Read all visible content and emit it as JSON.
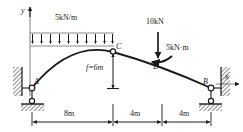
{
  "figure": {
    "type": "three-hinged-arch-free-body-diagram",
    "axes": {
      "y_label": "y",
      "x_label": "x"
    },
    "points": {
      "a": "A",
      "b": "B",
      "c": "C",
      "d": "D"
    },
    "loads": {
      "distributed": "5kN/m",
      "point_force": "10kN",
      "moment": "5kN·m"
    },
    "dimensions": {
      "rise": "f=6m",
      "span_1": "8m",
      "span_2": "4m",
      "span_3": "4m"
    },
    "colors": {
      "line": "#1a1a1a",
      "background": "#ffffff",
      "hatch": "#1a1a1a"
    }
  }
}
